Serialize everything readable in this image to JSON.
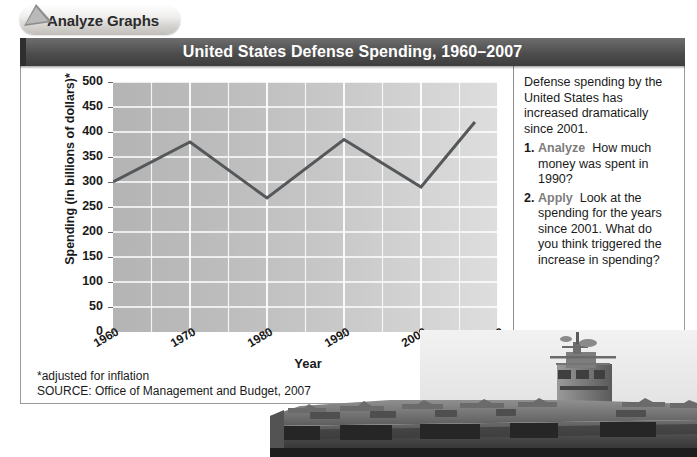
{
  "tab": {
    "label": "Analyze Graphs",
    "pointer_icon": "arrow-pointer-icon"
  },
  "header": {
    "title": "United States Defense Spending, 1960–2007"
  },
  "chart_data": {
    "type": "line",
    "title": "United States Defense Spending, 1960–2007",
    "xlabel": "Year",
    "ylabel": "Spending (in billions of dollars)*",
    "xlim": [
      1960,
      2010
    ],
    "ylim": [
      0,
      500
    ],
    "xticks": [
      "1960",
      "1970",
      "1980",
      "1990",
      "2000",
      "2010"
    ],
    "yticks": [
      "0",
      "50",
      "100",
      "150",
      "200",
      "250",
      "300",
      "350",
      "400",
      "450",
      "500"
    ],
    "grid": true,
    "legend": "none",
    "series": [
      {
        "name": "Defense spending",
        "x": [
          1960,
          1970,
          1980,
          1990,
          2000,
          2007
        ],
        "values": [
          300,
          380,
          268,
          385,
          290,
          420
        ]
      }
    ],
    "line_color": "#55585a",
    "plot_bg_left": "#b4b4b4",
    "plot_bg_right": "#dedede",
    "gridline_color": "#ffffff"
  },
  "footnote": {
    "adjusted": "*adjusted for inflation",
    "source": "SOURCE: Office of Management and Budget, 2007"
  },
  "side_panel": {
    "intro": "Defense spending by the United States has increased dramatically since 2001.",
    "questions": [
      {
        "num": "1.",
        "keyword": "Analyze",
        "text": "How much money was spent in 1990?"
      },
      {
        "num": "2.",
        "keyword": "Apply",
        "text": "Look at the spending for the years since 2001. What do you think triggered the increase in spending?"
      }
    ]
  },
  "photo": {
    "name": "aircraft-carrier-photo"
  },
  "colors": {
    "title_bar": "#4b4b4b",
    "keyword": "#7d7d7d",
    "text": "#1a1a1a"
  }
}
